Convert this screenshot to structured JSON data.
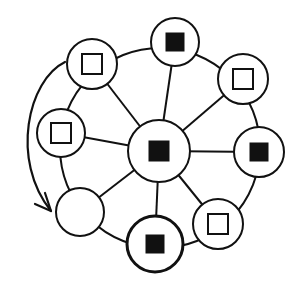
{
  "diagram": {
    "title": "",
    "stroke_color": "#111111",
    "fill_color": "#ffffff",
    "ring": {
      "cx": 160,
      "cy": 148,
      "r": 100
    },
    "center_node": {
      "id": "center",
      "cx": 159,
      "cy": 151,
      "r": 31,
      "marker": "filled-square",
      "marker_size": 21
    },
    "outer_nodes": [
      {
        "id": "top",
        "cx": 175,
        "cy": 42,
        "r": 24,
        "marker": "filled-square",
        "marker_size": 19
      },
      {
        "id": "top-right",
        "cx": 243,
        "cy": 79,
        "r": 25,
        "marker": "open-square",
        "marker_size": 20
      },
      {
        "id": "right",
        "cx": 259,
        "cy": 152,
        "r": 25,
        "marker": "filled-square",
        "marker_size": 19
      },
      {
        "id": "bottom-right",
        "cx": 218,
        "cy": 224,
        "r": 25,
        "marker": "open-square",
        "marker_size": 20
      },
      {
        "id": "bottom",
        "cx": 155,
        "cy": 244,
        "r": 28,
        "marker": "filled-square",
        "marker_size": 19,
        "bold": true
      },
      {
        "id": "bottom-left",
        "cx": 80,
        "cy": 212,
        "r": 24,
        "marker": "none",
        "marker_size": 0
      },
      {
        "id": "left",
        "cx": 61,
        "cy": 133,
        "r": 24,
        "marker": "open-square",
        "marker_size": 20
      },
      {
        "id": "top-left",
        "cx": 92,
        "cy": 64,
        "r": 25,
        "marker": "open-square",
        "marker_size": 20
      }
    ],
    "arrow": {
      "description": "curved arrow from top-left node to bottom-left node along outside of ring",
      "path": "M 65 62 C 28 80, 10 160, 51 211",
      "head": "M 35 204 L 51 211 L 45 193"
    }
  }
}
